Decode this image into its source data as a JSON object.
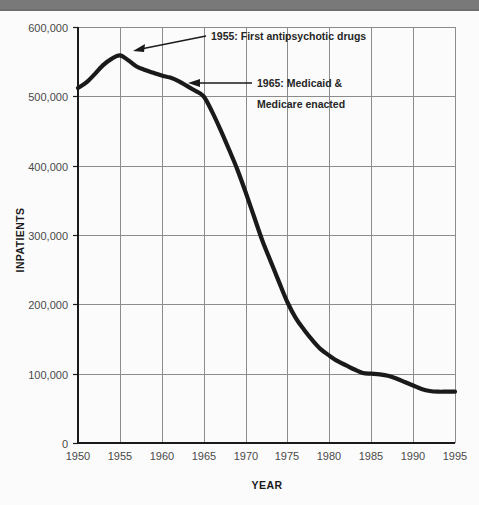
{
  "window": {
    "titlebar_color": "#6e6e6e",
    "background_color": "#fbfbfb"
  },
  "chart_data": {
    "type": "line",
    "title": "",
    "subtitle": "",
    "xlabel": "YEAR",
    "ylabel": "INPATIENTS",
    "xlim": [
      1950,
      1995
    ],
    "ylim": [
      0,
      600000
    ],
    "grid": true,
    "legend": false,
    "line_color": "#1a1a1a",
    "gridline_color": "#8c8c8c",
    "axis_color": "#1a1a1a",
    "x_ticks": [
      1950,
      1955,
      1960,
      1965,
      1970,
      1975,
      1980,
      1985,
      1990,
      1995
    ],
    "x_tick_labels": [
      "1950",
      "1955",
      "1960",
      "1965",
      "1970",
      "1975",
      "1980",
      "1985",
      "1990",
      "1995"
    ],
    "y_ticks": [
      0,
      100000,
      200000,
      300000,
      400000,
      500000,
      600000
    ],
    "y_tick_labels": [
      "0",
      "100,000",
      "200,000",
      "300,000",
      "400,000",
      "500,000",
      "600,000"
    ],
    "series": [
      {
        "name": "Inpatients",
        "x": [
          1950,
          1951,
          1952,
          1953,
          1954,
          1955,
          1956,
          1957,
          1958,
          1959,
          1960,
          1961,
          1962,
          1963,
          1964,
          1965,
          1966,
          1967,
          1968,
          1969,
          1970,
          1971,
          1972,
          1973,
          1974,
          1975,
          1976,
          1977,
          1978,
          1979,
          1980,
          1981,
          1982,
          1983,
          1984,
          1985,
          1986,
          1987,
          1988,
          1989,
          1990,
          1991,
          1992,
          1993,
          1994,
          1995
        ],
        "values": [
          512000,
          520000,
          532000,
          545000,
          554000,
          559000,
          552000,
          543000,
          538000,
          534000,
          530000,
          527000,
          522000,
          515000,
          508000,
          500000,
          478000,
          452000,
          424000,
          395000,
          362000,
          327000,
          292000,
          262000,
          232000,
          203000,
          180000,
          163000,
          148000,
          135000,
          126000,
          118000,
          112000,
          106000,
          101000,
          100000,
          99000,
          97000,
          93000,
          88000,
          83000,
          78000,
          75000,
          74000,
          74000,
          74000
        ]
      }
    ],
    "annotations": [
      {
        "id": "annotation-1955",
        "label_line_1": "1955: First antipsychotic drugs",
        "label_line_2": "",
        "point_year": 1955,
        "point_value": 559000
      },
      {
        "id": "annotation-1965",
        "label_line_1": "1965: Medicaid &",
        "label_line_2": "Medicare enacted",
        "point_year": 1965,
        "point_value": 500000
      }
    ]
  }
}
